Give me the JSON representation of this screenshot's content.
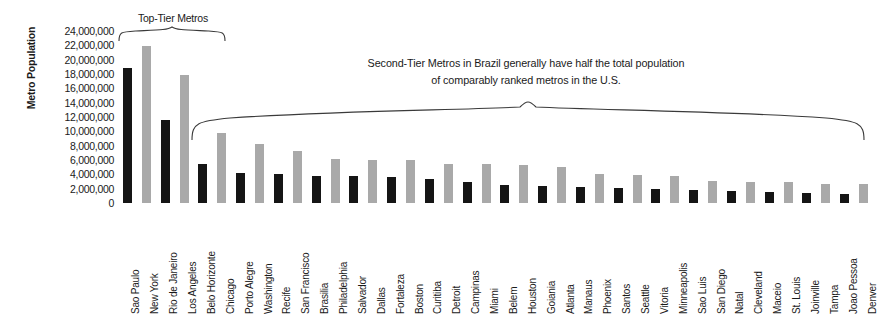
{
  "chart_data": {
    "type": "bar",
    "title": "",
    "xlabel": "",
    "ylabel": "Metro Population",
    "ylim": [
      0,
      24000000
    ],
    "grid": false,
    "legend": null,
    "y_ticks": [
      "24,000,000",
      "22,000,000",
      "20,000,000",
      "18,000,000",
      "16,000,000",
      "14,000,000",
      "12,000,000",
      "10,000,000",
      "8,000,000",
      "6,000,000",
      "4,000,000",
      "2,000,000",
      "0"
    ],
    "y_tick_values": [
      24000000,
      22000000,
      20000000,
      18000000,
      16000000,
      14000000,
      12000000,
      10000000,
      8000000,
      6000000,
      4000000,
      2000000,
      0
    ],
    "categories": [
      "Sao Paulo",
      "New York",
      "Rio de Janeiro",
      "Los Angeles",
      "Belo Horizonte",
      "Chicago",
      "Porto Alegre",
      "Washington",
      "Recife",
      "San Francisco",
      "Brasilia",
      "Philadelphia",
      "Salvador",
      "Dallas",
      "Fortaleza",
      "Boston",
      "Curitiba",
      "Detroit",
      "Campinas",
      "Miami",
      "Belem",
      "Houston",
      "Goiania",
      "Atlanta",
      "Manaus",
      "Phoenix",
      "Santos",
      "Seattle",
      "Vitoria",
      "Minneapolis",
      "Sao Luis",
      "San Diego",
      "Natal",
      "Cleveland",
      "Maceio",
      "St. Louis",
      "Joinville",
      "Tampa",
      "Joao Pessoa",
      "Denver"
    ],
    "values": [
      18800000,
      21900000,
      11600000,
      17800000,
      5500000,
      9800000,
      4200000,
      8200000,
      4000000,
      7200000,
      3800000,
      6100000,
      3700000,
      6000000,
      3600000,
      6000000,
      3300000,
      5500000,
      3000000,
      5400000,
      2500000,
      5300000,
      2400000,
      5000000,
      2200000,
      4000000,
      2100000,
      3900000,
      2000000,
      3800000,
      1800000,
      3100000,
      1700000,
      3000000,
      1600000,
      2900000,
      1400000,
      2700000,
      1300000,
      2600000
    ],
    "country": [
      "Brazil",
      "U.S.",
      "Brazil",
      "U.S.",
      "Brazil",
      "U.S.",
      "Brazil",
      "U.S.",
      "Brazil",
      "U.S.",
      "Brazil",
      "U.S.",
      "Brazil",
      "U.S.",
      "Brazil",
      "U.S.",
      "Brazil",
      "U.S.",
      "Brazil",
      "U.S.",
      "Brazil",
      "U.S.",
      "Brazil",
      "U.S.",
      "Brazil",
      "U.S.",
      "Brazil",
      "U.S.",
      "Brazil",
      "U.S.",
      "Brazil",
      "U.S.",
      "Brazil",
      "U.S.",
      "Brazil",
      "U.S.",
      "Brazil",
      "U.S.",
      "Brazil",
      "U.S."
    ],
    "colors": {
      "brazil_bar": "#151515",
      "us_bar": "#a9a9a9",
      "background": "#ffffff",
      "text": "#1a1a1a"
    },
    "annotations": [
      {
        "name": "top-tier",
        "text": "Top-Tier Metros",
        "covers": [
          "Sao Paulo",
          "New York",
          "Rio de Janeiro",
          "Los Angeles"
        ]
      },
      {
        "name": "second-tier",
        "line1": "Second-Tier Metros in Brazil generally have half the total population",
        "line2": "of comparably ranked metros in the U.S.",
        "covers_from": "Belo Horizonte",
        "covers_to": "Denver"
      }
    ]
  },
  "annotations": {
    "top_tier_caption": "Top-Tier Metros",
    "second_tier_line1": "Second-Tier Metros in Brazil generally have half the total population",
    "second_tier_line2": "of comparably ranked metros in the U.S."
  },
  "axes": {
    "y_title": "Metro Population"
  }
}
